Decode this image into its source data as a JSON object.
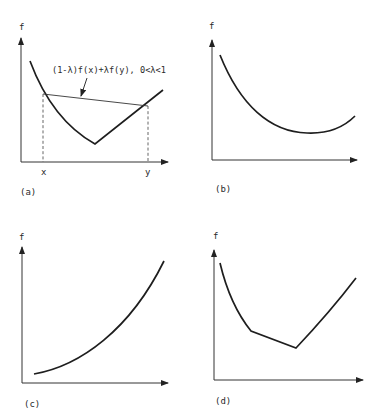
{
  "panels": [
    {
      "id": "a",
      "caption": "(a)",
      "y_label": "f",
      "x_ticks": [
        "x",
        "y"
      ],
      "annotation": "(1-λ)f(x)+λf(y), 0<λ<1",
      "description": "Nonsmooth convex function with a kink; chord between x and y lies above the curve"
    },
    {
      "id": "b",
      "caption": "(b)",
      "y_label": "f",
      "description": "Smooth convex function with an interior minimum"
    },
    {
      "id": "c",
      "caption": "(c)",
      "y_label": "f",
      "description": "Smooth convex increasing function"
    },
    {
      "id": "d",
      "caption": "(d)",
      "y_label": "f",
      "description": "Piecewise convex function with two kinks"
    }
  ],
  "colors": {
    "background": "#ffffff",
    "ink": "#1e1e1e"
  }
}
